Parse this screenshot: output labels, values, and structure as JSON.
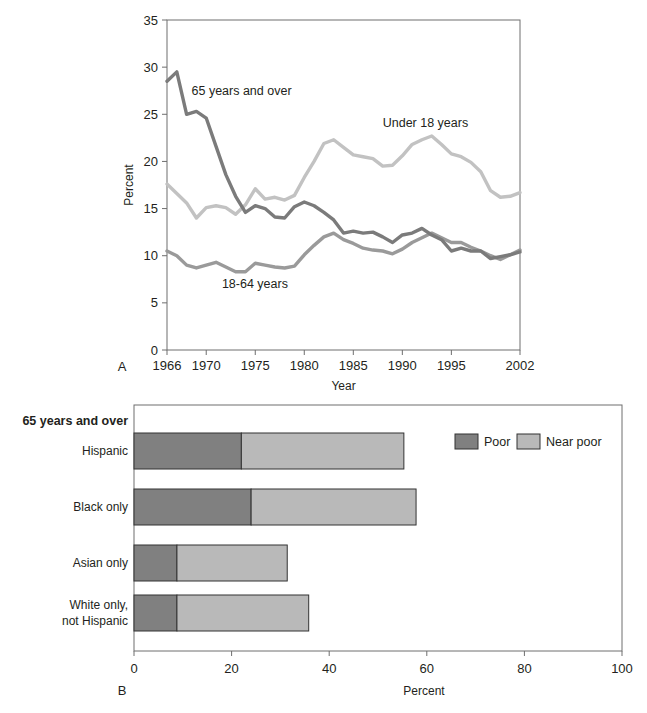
{
  "figure": {
    "panel_a_letter": "A",
    "panel_b_letter": "B"
  },
  "chart_data": [
    {
      "id": "panel-a",
      "type": "line",
      "title": "",
      "xlabel": "Year",
      "ylabel": "Percent",
      "xlim": [
        1966,
        2002
      ],
      "ylim": [
        0,
        35
      ],
      "ytick_labels": [
        "0",
        "5",
        "10",
        "15",
        "20",
        "25",
        "30",
        "35"
      ],
      "yticks": [
        0,
        5,
        10,
        15,
        20,
        25,
        30,
        35
      ],
      "xtick_labels": [
        "1966",
        "1970",
        "1975",
        "1980",
        "1985",
        "1990",
        "1995",
        "2002"
      ],
      "xticks": [
        1966,
        1970,
        1975,
        1980,
        1985,
        1990,
        1995,
        2002
      ],
      "grid": false,
      "legend_position": "inline-annotations",
      "annotations": [
        {
          "text": "65 years and over",
          "x": 1968.5,
          "y": 27.0
        },
        {
          "text": "Under 18 years",
          "x": 1988.0,
          "y": 23.6
        },
        {
          "text": "18-64 years",
          "x": 1971.6,
          "y": 6.6
        }
      ],
      "x": [
        1966,
        1967,
        1968,
        1969,
        1970,
        1971,
        1972,
        1973,
        1974,
        1975,
        1976,
        1977,
        1978,
        1979,
        1980,
        1981,
        1982,
        1983,
        1984,
        1985,
        1986,
        1987,
        1988,
        1989,
        1990,
        1991,
        1992,
        1993,
        1994,
        1995,
        1996,
        1997,
        1998,
        1999,
        2000,
        2001,
        2002
      ],
      "series": [
        {
          "name": "65 years and over",
          "color": "#7b7b7b",
          "values": [
            28.5,
            29.5,
            25.0,
            25.3,
            24.6,
            21.6,
            18.6,
            16.3,
            14.6,
            15.3,
            15.0,
            14.1,
            14.0,
            15.2,
            15.7,
            15.3,
            14.6,
            13.8,
            12.4,
            12.6,
            12.4,
            12.5,
            12.0,
            11.4,
            12.2,
            12.4,
            12.9,
            12.2,
            11.7,
            10.5,
            10.8,
            10.5,
            10.5,
            9.7,
            9.9,
            10.1,
            10.4
          ]
        },
        {
          "name": "Under 18 years",
          "color": "#c2c2c2",
          "values": [
            17.6,
            16.6,
            15.6,
            14.0,
            15.1,
            15.3,
            15.1,
            14.4,
            15.4,
            17.1,
            16.0,
            16.2,
            15.9,
            16.4,
            18.3,
            20.0,
            21.9,
            22.3,
            21.5,
            20.7,
            20.5,
            20.3,
            19.5,
            19.6,
            20.6,
            21.8,
            22.3,
            22.7,
            21.8,
            20.8,
            20.5,
            19.9,
            18.9,
            16.9,
            16.2,
            16.3,
            16.7
          ]
        },
        {
          "name": "18-64 years",
          "color": "#9a9a9a",
          "values": [
            10.5,
            10.0,
            9.0,
            8.7,
            9.0,
            9.3,
            8.8,
            8.3,
            8.3,
            9.2,
            9.0,
            8.8,
            8.7,
            8.9,
            10.1,
            11.1,
            12.0,
            12.4,
            11.7,
            11.3,
            10.8,
            10.6,
            10.5,
            10.2,
            10.7,
            11.4,
            11.9,
            12.4,
            11.9,
            11.4,
            11.4,
            10.9,
            10.5,
            10.0,
            9.6,
            10.1,
            10.6
          ]
        }
      ]
    },
    {
      "id": "panel-b",
      "type": "bar",
      "orientation": "horizontal",
      "stacked": true,
      "group_title": "65 years and over",
      "xlabel": "Percent",
      "ylabel": "",
      "xlim": [
        0,
        100
      ],
      "xticks": [
        0,
        20,
        40,
        60,
        80,
        100
      ],
      "xtick_labels": [
        "0",
        "20",
        "40",
        "60",
        "80",
        "100"
      ],
      "grid": false,
      "legend_position": "inside-top-right",
      "categories": [
        "Hispanic",
        "Black only",
        "Asian only",
        "White only,\nnot Hispanic"
      ],
      "series": [
        {
          "name": "Poor",
          "color": "#808080",
          "values": [
            22.0,
            24.0,
            8.8,
            8.8
          ]
        },
        {
          "name": "Near poor",
          "color": "#b9b9b9",
          "values": [
            33.3,
            33.8,
            22.6,
            27.0
          ]
        }
      ],
      "totals": [
        55.3,
        57.8,
        31.4,
        35.8
      ]
    }
  ]
}
